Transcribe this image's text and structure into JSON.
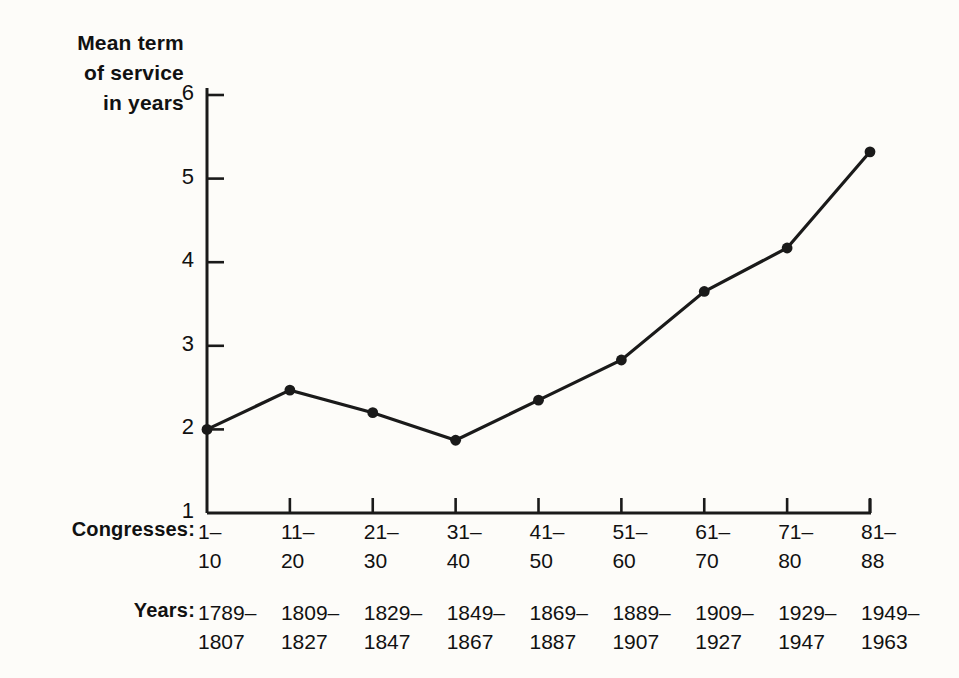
{
  "figure": {
    "background_color": "#fdfcf9",
    "ink_color": "#1a1a1a",
    "y_axis_title": "Mean term\nof service\nin years",
    "congresses_key": "Congresses:",
    "years_key": "Years:"
  },
  "chart_data": {
    "type": "line",
    "title": "",
    "subtitle": "",
    "xlabel": "Congresses",
    "ylabel": "Mean term of service in years",
    "ylim": [
      1,
      6
    ],
    "yticks": [
      1,
      2,
      3,
      4,
      5,
      6
    ],
    "ytick_labels": [
      "1",
      "2",
      "3",
      "4",
      "5",
      "6"
    ],
    "grid": false,
    "legend": "none",
    "marker": "filled-circle",
    "line_color": "#1a1a1a",
    "categories": [
      "1–10",
      "11–20",
      "21–30",
      "31–40",
      "41–50",
      "51–60",
      "61–70",
      "71–80",
      "81–88"
    ],
    "category_label_lines": [
      [
        "1–",
        "10"
      ],
      [
        "11–",
        "20"
      ],
      [
        "21–",
        "30"
      ],
      [
        "31–",
        "40"
      ],
      [
        "41–",
        "50"
      ],
      [
        "51–",
        "60"
      ],
      [
        "61–",
        "70"
      ],
      [
        "71–",
        "80"
      ],
      [
        "81–",
        "88"
      ]
    ],
    "secondary_categories": [
      "1789–1807",
      "1809–1827",
      "1829–1847",
      "1849–1867",
      "1869–1887",
      "1889–1907",
      "1909–1927",
      "1929–1947",
      "1949–1963"
    ],
    "secondary_category_label_lines": [
      [
        "1789–",
        "1807"
      ],
      [
        "1809–",
        "1827"
      ],
      [
        "1829–",
        "1847"
      ],
      [
        "1849–",
        "1867"
      ],
      [
        "1869–",
        "1887"
      ],
      [
        "1889–",
        "1907"
      ],
      [
        "1909–",
        "1927"
      ],
      [
        "1929–",
        "1947"
      ],
      [
        "1949–",
        "1963"
      ]
    ],
    "values": [
      2.0,
      2.47,
      2.2,
      1.87,
      2.35,
      2.83,
      3.65,
      4.17,
      5.32
    ]
  }
}
